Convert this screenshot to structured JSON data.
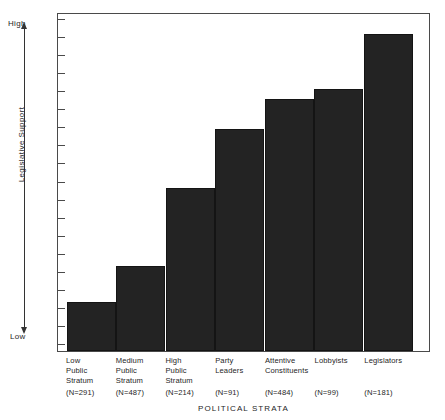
{
  "chart_data": {
    "type": "bar",
    "title": "",
    "xlabel": "POLITICAL STRATA",
    "ylabel": "Legislative Support",
    "ylim": [
      0,
      100
    ],
    "y_axis_low_label": "Low",
    "y_axis_high_label": "High",
    "y_tick_count": 19,
    "grid": false,
    "legend": "none",
    "bar_color": "#232323",
    "frame_color": "#4a4a4a",
    "categories": [
      "Low Public Stratum",
      "Medium Public Stratum",
      "High Public Stratum",
      "Party Leaders",
      "Attentive Constituents",
      "Lobbyists",
      "Legislators"
    ],
    "values": [
      15,
      26,
      50,
      68,
      77,
      80,
      97
    ],
    "bars": [
      {
        "label_lines": [
          "Low",
          "Public",
          "Stratum"
        ],
        "n_label": "(N=291)",
        "n": 291,
        "value": 15
      },
      {
        "label_lines": [
          "Medium",
          "Public",
          "Stratum"
        ],
        "n_label": "(N=487)",
        "n": 487,
        "value": 26
      },
      {
        "label_lines": [
          "High",
          "Public",
          "Stratum"
        ],
        "n_label": "(N=214)",
        "n": 214,
        "value": 50
      },
      {
        "label_lines": [
          "Party",
          "Leaders"
        ],
        "n_label": "(N=91)",
        "n": 91,
        "value": 68
      },
      {
        "label_lines": [
          "Attentive",
          "Constituents"
        ],
        "n_label": "(N=484)",
        "n": 484,
        "value": 77
      },
      {
        "label_lines": [
          "Lobbyists"
        ],
        "n_label": "(N=99)",
        "n": 99,
        "value": 80
      },
      {
        "label_lines": [
          "Legislators"
        ],
        "n_label": "(N=181)",
        "n": 181,
        "value": 97
      }
    ]
  }
}
